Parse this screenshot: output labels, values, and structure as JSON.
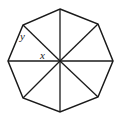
{
  "diagram": {
    "shape": "regular octagon",
    "vertices": [
      [
        60,
        9
      ],
      [
        98,
        24
      ],
      [
        113,
        61
      ],
      [
        98,
        97
      ],
      [
        60,
        112
      ],
      [
        23,
        98
      ],
      [
        8,
        61
      ],
      [
        23,
        25
      ]
    ],
    "center": [
      60,
      61
    ],
    "stroke_color": "#1a1a1a",
    "background": "#ffffff",
    "labels": {
      "y": "y",
      "x": "x"
    }
  }
}
